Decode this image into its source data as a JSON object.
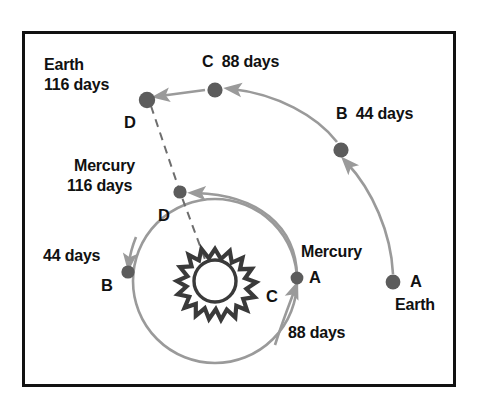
{
  "figure": {
    "frame": {
      "border_color": "#111111",
      "background": "#ffffff"
    },
    "colors": {
      "planet_dot": "#5c5c5c",
      "orbit_arc": "#9a9a9a",
      "dashed_line": "#6e6e6e",
      "sun_outline": "#3a3a3a",
      "text": "#111111"
    },
    "sun": {
      "name": "Sun",
      "center_x": 215,
      "center_y": 281,
      "radius": 21,
      "spikes": 16
    }
  },
  "mercury": {
    "name": "Mercury",
    "orbit_label_days": "88 days",
    "positions": [
      {
        "id": "A",
        "label": "A",
        "name_label": "Mercury",
        "x": 297,
        "y": 278,
        "days": 0
      },
      {
        "id": "B",
        "label": "B",
        "days_label": "44 days",
        "x": 128,
        "y": 272,
        "days": 44
      },
      {
        "id": "D",
        "label": "D",
        "name_label": "Mercury",
        "days_label": "116 days",
        "x": 180,
        "y": 192,
        "days": 116
      }
    ]
  },
  "earth": {
    "name": "Earth",
    "positions": [
      {
        "id": "A",
        "label": "A",
        "name_label": "Earth",
        "x": 393,
        "y": 282,
        "days": 0
      },
      {
        "id": "B",
        "label": "B",
        "days_label": "44 days",
        "x": 340,
        "y": 150,
        "days": 44
      },
      {
        "id": "C",
        "label": "C",
        "days_label": "88 days",
        "x": 215,
        "y": 88,
        "days": 88
      },
      {
        "id": "D",
        "label": "D",
        "name_label": "Earth",
        "days_label": "116 days",
        "x": 148,
        "y": 98,
        "days": 116
      }
    ]
  },
  "labels": {
    "earth_d_name": "Earth",
    "earth_d_days": "116 days",
    "earth_d_point": "D",
    "earth_c": "C  88 days",
    "earth_b": "B  44 days",
    "earth_a_point": "A",
    "earth_a_name": "Earth",
    "mercury_d_name": "Mercury",
    "mercury_d_days": "116 days",
    "mercury_d_point": "D",
    "mercury_b_days": "44 days",
    "mercury_b_point": "B",
    "mercury_a_name": "Mercury",
    "mercury_a_point": "A",
    "mercury_c_point": "C",
    "mercury_days": "88 days"
  }
}
